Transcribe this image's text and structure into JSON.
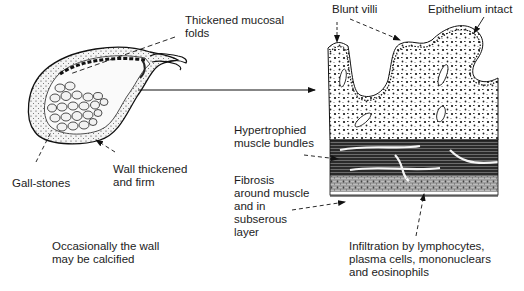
{
  "figure": {
    "type": "pathology-illustration",
    "left_panel": {
      "name": "gallbladder",
      "labels": {
        "mucosal_folds": "Thickened mucosal\nfolds",
        "gallstones": "Gall-stones",
        "wall": "Wall thickened\nand firm",
        "calcified": "Occasionally the wall\nmay be calcified"
      }
    },
    "right_panel": {
      "name": "wall-section",
      "labels": {
        "blunt_villi": "Blunt villi",
        "epithelium": "Epithelium intact",
        "muscle": "Hypertrophied\nmuscle bundles",
        "fibrosis": "Fibrosis\naround muscle\nand in\nsubserous\nlayer",
        "infiltration": "Infiltration by lymphocytes,\nplasma cells, mononuclears\nand eosinophils"
      }
    },
    "colors": {
      "ink": "#1a1a1a",
      "background": "#ffffff",
      "shade": "#555555"
    }
  }
}
